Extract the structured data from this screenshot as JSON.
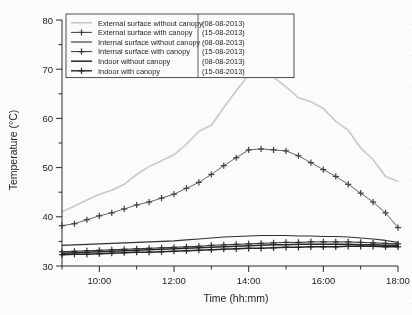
{
  "chart_data": {
    "type": "line",
    "title": "",
    "xlabel": "Time (hh:mm)",
    "ylabel": "Temperature (°C)",
    "xlim": [
      "09:00",
      "18:00"
    ],
    "ylim": [
      30,
      80
    ],
    "yticks": [
      30,
      40,
      50,
      60,
      70,
      80
    ],
    "yticks_minor": [
      35,
      45,
      55,
      65,
      75
    ],
    "xticks": [
      "10:00",
      "12:00",
      "14:00",
      "16:00",
      "18:00"
    ],
    "xticks_minor": [
      "09:00",
      "11:00",
      "13:00",
      "15:00",
      "17:00"
    ],
    "grid": false,
    "legend_position": "top-left",
    "x": [
      "09:00",
      "09:20",
      "09:40",
      "10:00",
      "10:20",
      "10:40",
      "11:00",
      "11:20",
      "11:40",
      "12:00",
      "12:20",
      "12:40",
      "13:00",
      "13:20",
      "13:40",
      "14:00",
      "14:20",
      "14:40",
      "15:00",
      "15:20",
      "15:40",
      "16:00",
      "16:20",
      "16:40",
      "17:00",
      "17:20",
      "17:40",
      "18:00"
    ],
    "series": [
      {
        "name": "External surface without canopy",
        "date": "(08-08-2013)",
        "color": "#c9c9c9",
        "marker": "none",
        "linewidth": 1.6,
        "values": [
          41.0,
          42.2,
          43.4,
          44.6,
          45.4,
          46.6,
          48.6,
          50.2,
          51.4,
          52.6,
          54.8,
          57.4,
          58.6,
          62.2,
          65.6,
          68.8,
          69.8,
          68.4,
          66.4,
          64.2,
          63.4,
          62.0,
          59.4,
          57.6,
          54.0,
          51.6,
          48.2,
          47.2
        ]
      },
      {
        "name": "External surface with canopy",
        "date": "(15-08-2013)",
        "color": "#3a3a3a",
        "marker": "plus",
        "linewidth": 0.8,
        "values": [
          38.2,
          38.6,
          39.4,
          40.2,
          40.8,
          41.6,
          42.4,
          43.0,
          43.8,
          44.6,
          45.8,
          47.0,
          48.6,
          50.4,
          52.0,
          53.6,
          53.8,
          53.6,
          53.4,
          52.4,
          51.0,
          49.6,
          48.2,
          46.6,
          44.8,
          43.0,
          40.8,
          37.8
        ]
      },
      {
        "name": "Internal surface without canopy",
        "date": "(08-08-2013)",
        "color": "#2a2a2a",
        "marker": "none",
        "linewidth": 1.1,
        "values": [
          34.2,
          34.3,
          34.4,
          34.5,
          34.6,
          34.7,
          34.8,
          34.9,
          35.0,
          35.1,
          35.3,
          35.5,
          35.7,
          35.9,
          36.0,
          36.1,
          36.2,
          36.2,
          36.2,
          36.1,
          36.1,
          36.0,
          36.0,
          35.9,
          35.7,
          35.5,
          35.2,
          34.8
        ]
      },
      {
        "name": "Internal surface with canopy",
        "date": "(15-08-2013)",
        "color": "#2a2a2a",
        "marker": "plus",
        "linewidth": 1.0,
        "values": [
          32.9,
          33.0,
          33.1,
          33.2,
          33.3,
          33.4,
          33.5,
          33.6,
          33.7,
          33.8,
          33.9,
          34.0,
          34.2,
          34.3,
          34.4,
          34.5,
          34.6,
          34.7,
          34.8,
          34.8,
          34.9,
          34.9,
          34.9,
          34.9,
          34.8,
          34.7,
          34.6,
          34.5
        ]
      },
      {
        "name": "Indoor without canopy",
        "date": "(08-08-2013)",
        "color": "#1d1d1d",
        "marker": "none",
        "linewidth": 1.5,
        "values": [
          32.6,
          32.7,
          32.8,
          32.9,
          33.0,
          33.1,
          33.2,
          33.3,
          33.4,
          33.5,
          33.6,
          33.7,
          33.8,
          33.9,
          34.0,
          34.1,
          34.2,
          34.3,
          34.3,
          34.4,
          34.4,
          34.4,
          34.4,
          34.4,
          34.3,
          34.3,
          34.2,
          34.2
        ]
      },
      {
        "name": "Indoor with canopy",
        "date": "(15-08-2013)",
        "color": "#1d1d1d",
        "marker": "plus",
        "linewidth": 1.4,
        "values": [
          32.3,
          32.4,
          32.4,
          32.5,
          32.6,
          32.7,
          32.8,
          32.8,
          32.9,
          33.0,
          33.1,
          33.2,
          33.3,
          33.4,
          33.5,
          33.6,
          33.6,
          33.7,
          33.8,
          33.8,
          33.9,
          33.9,
          33.9,
          34.0,
          34.0,
          34.0,
          33.9,
          33.9
        ]
      }
    ]
  }
}
